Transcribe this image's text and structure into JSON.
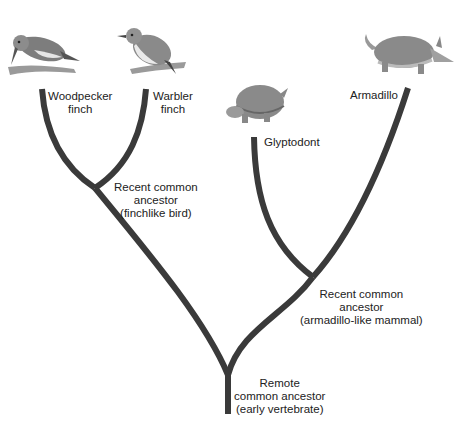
{
  "diagram": {
    "type": "phylogenetic-tree",
    "colors": {
      "branch": "#3a3a3a",
      "text": "#222222",
      "background": "#ffffff",
      "illustration": "#8a8a8a"
    },
    "taxa": [
      {
        "id": "woodpecker_finch",
        "line1": "Woodpecker",
        "line2": "finch",
        "illustration": "woodpecker-finch-bird"
      },
      {
        "id": "warbler_finch",
        "line1": "Warbler",
        "line2": "finch",
        "illustration": "warbler-finch-bird"
      },
      {
        "id": "glyptodont",
        "line1": "Glyptodont",
        "illustration": "glyptodont"
      },
      {
        "id": "armadillo",
        "line1": "Armadillo",
        "illustration": "armadillo"
      }
    ],
    "nodes": [
      {
        "id": "finch_ancestor",
        "line1": "Recent common",
        "line2": "ancestor",
        "line3": "(finchlike bird)"
      },
      {
        "id": "mammal_ancestor",
        "line1": "Recent common",
        "line2": "ancestor",
        "line3": "(armadillo-like mammal)"
      },
      {
        "id": "root",
        "line1": "Remote",
        "line2": "common ancestor",
        "line3": "(early vertebrate)"
      }
    ]
  }
}
